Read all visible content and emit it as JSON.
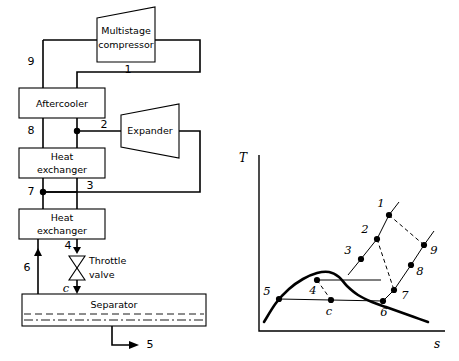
{
  "figure": {
    "left_panel_name": "process-flow-diagram",
    "right_panel_name": "temperature-entropy-diagram"
  },
  "flowsheet": {
    "equipment": [
      {
        "id": "multistage-compressor",
        "label_line1": "Multistage",
        "label_line2": "compressor"
      },
      {
        "id": "aftercooler",
        "label_line1": "Aftercooler",
        "label_line2": ""
      },
      {
        "id": "heat-exchanger-upper",
        "label_line1": "Heat",
        "label_line2": "exchanger"
      },
      {
        "id": "heat-exchanger-lower",
        "label_line1": "Heat",
        "label_line2": "exchanger"
      },
      {
        "id": "expander",
        "label_line1": "Expander",
        "label_line2": ""
      },
      {
        "id": "separator",
        "label_line1": "Separator",
        "label_line2": ""
      }
    ],
    "throttle_valve": {
      "label_line1": "Throttle",
      "label_line2": "valve"
    },
    "stream_labels": {
      "s1": "1",
      "s2": "2",
      "s3": "3",
      "s4": "4",
      "s5": "5",
      "s6": "6",
      "s7": "7",
      "s8": "8",
      "s9": "9",
      "sc": "c"
    }
  },
  "chart_data": {
    "type": "line",
    "title": "",
    "xlabel": "s",
    "ylabel": "T",
    "grid": false,
    "legend": null,
    "axis_origin": {
      "x": 259,
      "y": 331
    },
    "state_points": [
      {
        "label": "1",
        "x": 389,
        "y": 215,
        "label_dx": -8,
        "label_dy": -11
      },
      {
        "label": "2",
        "x": 377,
        "y": 239,
        "label_dx": -12,
        "label_dy": -9
      },
      {
        "label": "3",
        "x": 361,
        "y": 259,
        "label_dx": -13,
        "label_dy": -8
      },
      {
        "label": "4",
        "x": 317,
        "y": 280,
        "label_dx": -4,
        "label_dy": 11
      },
      {
        "label": "5",
        "x": 279,
        "y": 299,
        "label_dx": -12,
        "label_dy": -7
      },
      {
        "label": "6",
        "x": 383,
        "y": 301,
        "label_dx": 1,
        "label_dy": 12
      },
      {
        "label": "7",
        "x": 394,
        "y": 290,
        "label_dx": 11,
        "label_dy": 6
      },
      {
        "label": "8",
        "x": 411,
        "y": 265,
        "label_dx": 9,
        "label_dy": 7
      },
      {
        "label": "9",
        "x": 424,
        "y": 245,
        "label_dx": 10,
        "label_dy": 6
      },
      {
        "label": "c",
        "x": 331,
        "y": 300,
        "label_dx": -2,
        "label_dy": 12
      }
    ],
    "solid_paths": [
      {
        "name": "compression-line-3-2-1",
        "points": [
          [
            348,
            275
          ],
          [
            361,
            259
          ],
          [
            377,
            239
          ],
          [
            389,
            215
          ],
          [
            399,
            202
          ]
        ]
      },
      {
        "name": "cooling-line-9-8-7-6",
        "points": [
          [
            434,
            231
          ],
          [
            424,
            245
          ],
          [
            411,
            265
          ],
          [
            394,
            290
          ],
          [
            383,
            301
          ]
        ]
      },
      {
        "name": "isobar-through-4",
        "points": [
          [
            317,
            280
          ],
          [
            381,
            280
          ]
        ]
      },
      {
        "name": "isobar-through-5-6",
        "points": [
          [
            279,
            299
          ],
          [
            383,
            301
          ]
        ]
      }
    ],
    "dashed_paths": [
      {
        "name": "expansion-1-to-9",
        "points": [
          [
            389,
            215
          ],
          [
            424,
            245
          ]
        ]
      },
      {
        "name": "expansion-2-to-7",
        "points": [
          [
            377,
            239
          ],
          [
            394,
            290
          ]
        ]
      },
      {
        "name": "separation-4-to-c",
        "points": [
          [
            317,
            280
          ],
          [
            331,
            300
          ]
        ]
      }
    ],
    "saturation_dome": {
      "name": "saturation-dome",
      "points": [
        [
          264,
          322
        ],
        [
          276,
          303
        ],
        [
          289,
          289
        ],
        [
          303,
          279
        ],
        [
          317,
          273
        ],
        [
          329,
          272
        ],
        [
          339,
          277
        ],
        [
          347,
          286
        ],
        [
          358,
          295
        ],
        [
          372,
          302
        ],
        [
          386,
          307
        ],
        [
          400,
          312
        ],
        [
          414,
          317
        ],
        [
          428,
          322
        ]
      ]
    }
  }
}
